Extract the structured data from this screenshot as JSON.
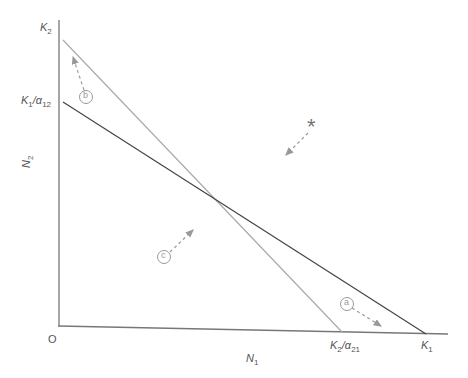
{
  "diagram": {
    "type": "isocline-phase-plane",
    "axes": {
      "origin_label": "O",
      "x_label": "N",
      "x_label_sub": "1",
      "y_label": "N",
      "y_label_sub": "2"
    },
    "intercepts": {
      "y_top": {
        "main": "K",
        "sub": "2"
      },
      "y_mid": {
        "main": "K",
        "sub": "1",
        "suffix": "/α",
        "suffix_sub": "12"
      },
      "x_mid": {
        "main": "K",
        "sub": "2",
        "suffix": "/α",
        "suffix_sub": "21"
      },
      "x_right": {
        "main": "K",
        "sub": "1"
      }
    },
    "lines": [
      {
        "name": "species-2-isocline",
        "color": "#aaaaaa",
        "from": "K2",
        "to": "K2/α21"
      },
      {
        "name": "species-1-isocline",
        "color": "#444444",
        "from": "K1/α12",
        "to": "K1"
      }
    ],
    "regions": [
      {
        "label": "a",
        "arrow": "down-right"
      },
      {
        "label": "b",
        "arrow": "up"
      },
      {
        "label": "c",
        "arrow": "up-right"
      }
    ],
    "equilibrium_marker": "*"
  }
}
